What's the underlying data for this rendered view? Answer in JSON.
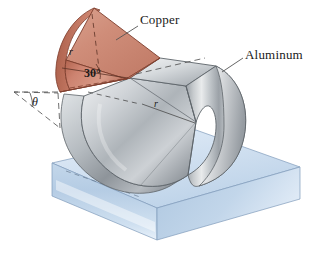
{
  "figure": {
    "background_color": "#ffffff"
  },
  "labels": {
    "copper": "Copper",
    "aluminum": "Aluminum",
    "angle": "30°",
    "radius_copper": "r",
    "radius_aluminum": "r",
    "theta": "θ"
  },
  "colors": {
    "copper_fill": "#cd8370",
    "copper_fill_light": "#dda28f",
    "copper_fill_dark": "#b06a58",
    "copper_edge": "#7d3d2d",
    "aluminum_light": "#eceef0",
    "aluminum_mid": "#b9bec3",
    "aluminum_dark": "#82888e",
    "aluminum_edge": "#5a6066",
    "base_top": "#d4e3f2",
    "base_front": "#b9cfe6",
    "base_side": "#a7c2de",
    "base_edge": "#6f8cab",
    "label_text": "#1a1a1a",
    "leader_line": "#555555",
    "dashed_line": "#4a4a4a"
  },
  "geometry": {
    "copper_wedge": {
      "description": "copper cylindrical wedge inclined upward to the left",
      "included_angle_deg": 30
    },
    "aluminum_body": {
      "description": "aluminum curved cylindrical solid resting on block"
    },
    "support_block": {
      "description": "light blue rectangular support slab"
    },
    "theta_wedge": {
      "description": "dashed angle wedge at left denoting theta"
    }
  }
}
